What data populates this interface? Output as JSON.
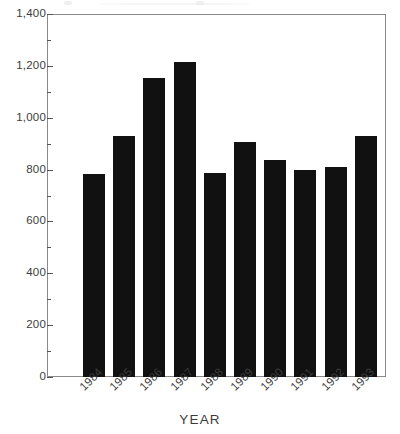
{
  "chart_data": {
    "type": "bar",
    "title": "",
    "xlabel": "YEAR",
    "ylabel": "",
    "categories": [
      "1984",
      "1985",
      "1986",
      "1987",
      "1988",
      "1989",
      "1990",
      "1991",
      "1992",
      "1993"
    ],
    "values": [
      783,
      929,
      1152,
      1216,
      787,
      906,
      837,
      797,
      808,
      928
    ],
    "ylim": [
      0,
      1400
    ],
    "ytick_values": [
      0,
      200,
      400,
      600,
      800,
      1000,
      1200,
      1400
    ],
    "ytick_labels": [
      "0",
      "200",
      "400",
      "600",
      "800",
      "1,000",
      "1,200",
      "1,400"
    ],
    "yminor_values": [
      100,
      300,
      500,
      700,
      900,
      1100,
      1300
    ],
    "grid": false,
    "legend": null,
    "bar_color": "#111111",
    "frame_color": "#8a8a8a",
    "text_color": "#3c3c3c",
    "xtick_rotation": -45
  }
}
